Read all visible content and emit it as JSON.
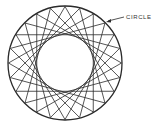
{
  "diagram": {
    "label": "CIRCLE",
    "points": 24,
    "skip": 8,
    "center": [
      65,
      63
    ],
    "radius": 57,
    "stroke": "#2a2a2a"
  }
}
